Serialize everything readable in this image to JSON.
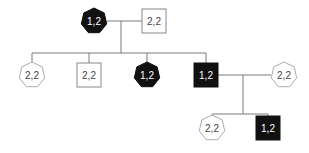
{
  "diagram": {
    "type": "pedigree",
    "colors": {
      "affected": "#111111",
      "unaffected": "#ffffff",
      "line": "#777777",
      "stroke": "#888888"
    },
    "individuals": [
      {
        "id": "I-1",
        "shape": "heptagon",
        "affected": true,
        "genotype": "1,2",
        "cx": 94,
        "cy": 21
      },
      {
        "id": "I-2",
        "shape": "square",
        "affected": false,
        "genotype": "2,2",
        "cx": 154,
        "cy": 21
      },
      {
        "id": "II-1",
        "shape": "heptagon",
        "affected": false,
        "genotype": "2,2",
        "cx": 32,
        "cy": 75
      },
      {
        "id": "II-2",
        "shape": "square",
        "affected": false,
        "genotype": "2,2",
        "cx": 89,
        "cy": 75
      },
      {
        "id": "II-3",
        "shape": "heptagon",
        "affected": true,
        "genotype": "1,2",
        "cx": 147,
        "cy": 75
      },
      {
        "id": "II-4",
        "shape": "square",
        "affected": true,
        "genotype": "1,2",
        "cx": 206,
        "cy": 75
      },
      {
        "id": "II-5",
        "shape": "heptagon",
        "affected": false,
        "genotype": "2,2",
        "cx": 284,
        "cy": 75
      },
      {
        "id": "III-1",
        "shape": "heptagon",
        "affected": false,
        "genotype": "2,2",
        "cx": 212,
        "cy": 128
      },
      {
        "id": "III-2",
        "shape": "square",
        "affected": true,
        "genotype": "1,2",
        "cx": 268,
        "cy": 128
      }
    ]
  }
}
